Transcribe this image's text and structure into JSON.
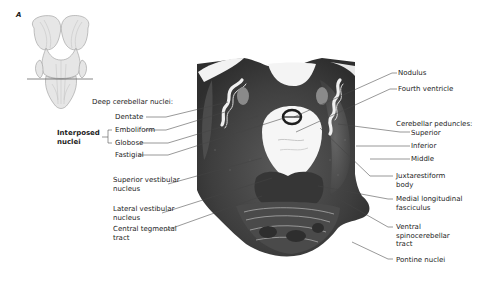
{
  "figure": {
    "panel_letter": "A",
    "colors": {
      "section_dark": "#3a3a3a",
      "section_mid": "#5c5c5c",
      "white_matter": "#f4f4f4",
      "leader_line": "#444444",
      "text": "#1c1c1c"
    }
  },
  "labels_left": {
    "deep_nuclei_heading": "Deep cerebellar nuclei:",
    "dentate": "Dentate",
    "emboliform": "Emboliform",
    "globose": "Globose",
    "fastigial": "Fastigial",
    "interposed_line1": "Interposed",
    "interposed_line2": "nuclei",
    "superior_vestibular_line1": "Superior vestibular",
    "superior_vestibular_line2": "nucleus",
    "lateral_vestibular_line1": "Lateral vestibular",
    "lateral_vestibular_line2": "nucleus",
    "central_tegmental_line1": "Central tegmental",
    "central_tegmental_line2": "tract"
  },
  "labels_right": {
    "nodulus": "Nodulus",
    "fourth_ventricle": "Fourth ventricle",
    "peduncles_heading": "Cerebellar peduncles:",
    "superior": "Superior",
    "inferior": "Inferior",
    "middle": "Middle",
    "juxtarestiform_line1": "Juxtarestiform",
    "juxtarestiform_line2": "body",
    "mlf_line1": "Medial longitudinal",
    "mlf_line2": "fasciculus",
    "vsct_line1": "Ventral",
    "vsct_line2": "spinocerebellar",
    "vsct_line3": "tract",
    "pontine_nuclei": "Pontine nuclei"
  }
}
